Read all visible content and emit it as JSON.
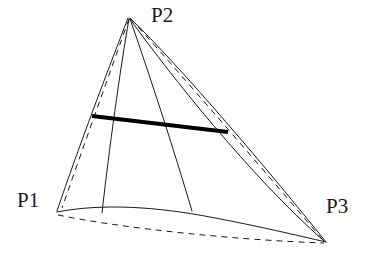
{
  "figure": {
    "background_color": "#ffffff",
    "stroke_color": "#1a1a1a",
    "thick_stroke_color": "#000000",
    "width": 375,
    "height": 259,
    "labels": {
      "p1": "P1",
      "p2": "P2",
      "p3": "P3"
    },
    "vertices": {
      "p1": {
        "x": 57,
        "y": 211
      },
      "p2": {
        "x": 129,
        "y": 17
      },
      "p3": {
        "x": 326,
        "y": 242
      }
    },
    "label_positions": {
      "p1": {
        "x": 17,
        "y": 190
      },
      "p2": {
        "x": 151,
        "y": 5
      },
      "p3": {
        "x": 326,
        "y": 196
      }
    },
    "thick_segment": {
      "name": "isoparametric-highlight",
      "x1": 92,
      "y1": 116,
      "x2": 228,
      "y2": 132,
      "width": 4
    },
    "curve_peak": {
      "x": 170,
      "y": 209
    },
    "interior_line_feet": [
      {
        "x": 102,
        "y": 213
      },
      {
        "x": 192,
        "y": 211
      }
    ],
    "stroke_widths": {
      "thin": 1,
      "thick": 4,
      "dashed": 1
    },
    "dash_pattern": "6 5"
  }
}
